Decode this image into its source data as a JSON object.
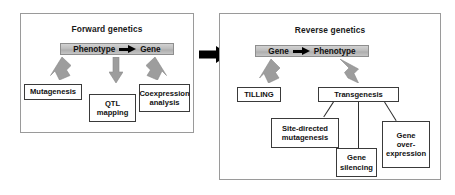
{
  "figure": {
    "panels": [
      {
        "id": "forward",
        "title": "Forward genetics",
        "banner": {
          "left_label": "Phenotype",
          "arrow_icon": "black-block-arrow-right",
          "right_label": "Gene"
        },
        "nodes": [
          {
            "id": "mutagenesis",
            "label": "Mutagenesis"
          },
          {
            "id": "qtl-mapping",
            "label": "QTL\nmapping",
            "line1": "QTL",
            "line2": "mapping"
          },
          {
            "id": "coexpression-analysis",
            "label": "Coexpression\nanalysis",
            "line1": "Coexpression",
            "line2": "analysis"
          }
        ]
      },
      {
        "id": "reverse",
        "title": "Reverse genetics",
        "banner": {
          "left_label": "Gene",
          "arrow_icon": "black-block-arrow-right",
          "right_label": "Phenotype"
        },
        "nodes": [
          {
            "id": "tilling",
            "label": "TILLING"
          },
          {
            "id": "transgenesis",
            "label": "Transgenesis"
          },
          {
            "id": "site-directed-mutagenesis",
            "label": "Site-directed\nmutagenesis",
            "line1": "Site-directed",
            "line2": "mutagenesis"
          },
          {
            "id": "gene-silencing",
            "label": "Gene\nsilencing",
            "line1": "Gene",
            "line2": "silencing"
          },
          {
            "id": "gene-overexpression",
            "label": "Gene\nover-\nexpression",
            "line1": "Gene",
            "line2": "over-",
            "line3": "expression"
          }
        ]
      }
    ],
    "connector": {
      "icon": "black-block-arrow-right",
      "from": "forward",
      "to": "reverse"
    },
    "colors": {
      "panel_border": "#9a9a9a",
      "node_border": "#3a3a3a",
      "banner_fill": "#bdbdbd",
      "grey_arrow": "#9d9d9d",
      "black_arrow": "#000000",
      "text": "#111111",
      "background": "#ffffff"
    }
  }
}
